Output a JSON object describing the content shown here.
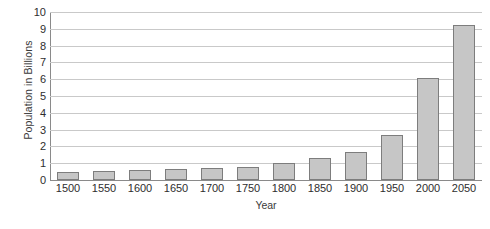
{
  "chart_data": {
    "type": "bar",
    "title": "",
    "xlabel": "Year",
    "ylabel": "Population in Billions",
    "categories": [
      "1500",
      "1550",
      "1600",
      "1650",
      "1700",
      "1750",
      "1800",
      "1850",
      "1900",
      "1950",
      "2000",
      "2050"
    ],
    "values": [
      0.5,
      0.55,
      0.6,
      0.65,
      0.7,
      0.8,
      1.0,
      1.3,
      1.65,
      2.7,
      6.1,
      9.2
    ],
    "ylim": [
      0,
      10
    ],
    "y_ticks": [
      0,
      1,
      2,
      3,
      4,
      5,
      6,
      7,
      8,
      9,
      10
    ],
    "y_tick_labels": [
      "0",
      "1",
      "2",
      "3",
      "4",
      "5",
      "6",
      "7",
      "8",
      "9",
      "10"
    ],
    "grid": true,
    "legend": false,
    "bar_color": "#c6c6c6",
    "bar_border_color": "#7d7d7d",
    "gridline_color": "#c9c9c9",
    "axis_color": "#8a8a8a"
  }
}
